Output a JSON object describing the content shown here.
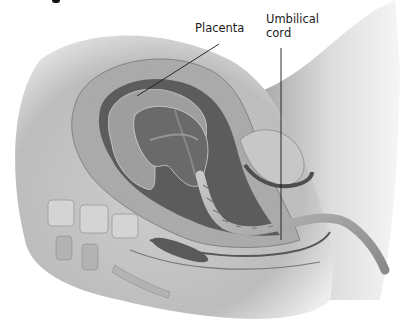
{
  "figure": {
    "style": "grayscale anatomical illustration",
    "colors": {
      "background": "#ffffff",
      "skin": "#d9d9d9",
      "uterine_wall": "#a8a8a8",
      "cavity_dark": "#5e5e5e",
      "placenta": "#9a9a9a",
      "cord": "#b5b5b5",
      "bone": "#cfcfcf",
      "leader_line": "#1a1a1a"
    }
  },
  "labels": {
    "placenta": "Placenta",
    "umbilical_cord_line1": "Umbilical",
    "umbilical_cord_line2": "cord"
  },
  "leaders": {
    "placenta": {
      "x1": 219,
      "y1": 44,
      "x2": 137,
      "y2": 96
    },
    "umbilical_cord": {
      "x1": 281,
      "y1": 48,
      "x2": 281,
      "y2": 240
    }
  }
}
